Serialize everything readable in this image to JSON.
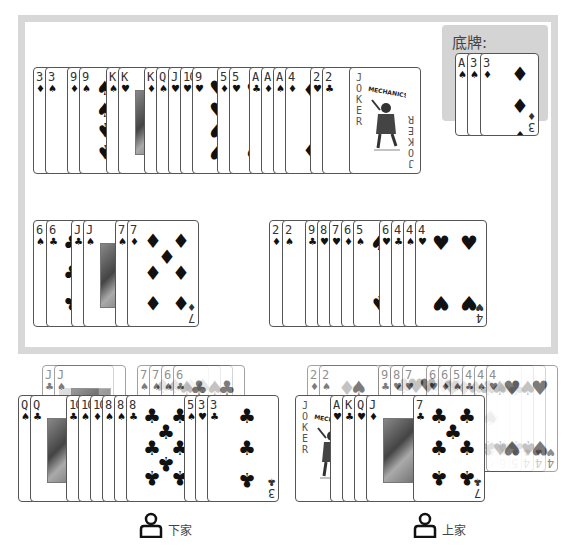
{
  "table": {
    "played_row_top": [
      {
        "rank": "3",
        "suit": "♦"
      },
      {
        "rank": "3",
        "suit": "♠"
      },
      {
        "rank": "9",
        "suit": "♦"
      },
      {
        "rank": "9",
        "suit": "♠"
      },
      {
        "rank": "K",
        "suit": "♠"
      },
      {
        "rank": "K",
        "suit": "♥"
      },
      {
        "rank": "K",
        "suit": "♦"
      },
      {
        "rank": "Q",
        "suit": "♠"
      },
      {
        "rank": "J",
        "suit": "♥"
      },
      {
        "rank": "10",
        "suit": "♥"
      },
      {
        "rank": "9",
        "suit": "♥"
      },
      {
        "rank": "5",
        "suit": "♦"
      },
      {
        "rank": "5",
        "suit": "♥"
      },
      {
        "rank": "A",
        "suit": "♣"
      },
      {
        "rank": "A",
        "suit": "♦"
      },
      {
        "rank": "A",
        "suit": "♠"
      },
      {
        "rank": "4",
        "suit": "♦"
      },
      {
        "rank": "2",
        "suit": "♥"
      },
      {
        "rank": "2",
        "suit": "♣"
      },
      {
        "rank": "JOKER",
        "suit": ""
      }
    ],
    "played_row_left": [
      {
        "rank": "6",
        "suit": "♠"
      },
      {
        "rank": "6",
        "suit": "♣"
      },
      {
        "rank": "J",
        "suit": "♣"
      },
      {
        "rank": "J",
        "suit": "♠"
      },
      {
        "rank": "7",
        "suit": "♠"
      },
      {
        "rank": "7",
        "suit": "♦"
      }
    ],
    "played_row_right": [
      {
        "rank": "2",
        "suit": "♦"
      },
      {
        "rank": "2",
        "suit": "♠"
      },
      {
        "rank": "9",
        "suit": "♣"
      },
      {
        "rank": "8",
        "suit": "♥"
      },
      {
        "rank": "7",
        "suit": "♥"
      },
      {
        "rank": "6",
        "suit": "♦"
      },
      {
        "rank": "5",
        "suit": "♠"
      },
      {
        "rank": "6",
        "suit": "♥"
      },
      {
        "rank": "4",
        "suit": "♣"
      },
      {
        "rank": "4",
        "suit": "♠"
      },
      {
        "rank": "4",
        "suit": "♥"
      }
    ],
    "joker_brand": "MECHANICS",
    "joker_word": "JOKER"
  },
  "bottom_cards": {
    "title": "底牌:",
    "cards": [
      {
        "rank": "A",
        "suit": "♠"
      },
      {
        "rank": "3",
        "suit": "♠"
      },
      {
        "rank": "3",
        "suit": "♦"
      }
    ]
  },
  "players": {
    "next": {
      "label": "下家",
      "icon": "user-icon",
      "hand_back_row": [
        {
          "rank": "J",
          "suit": "♣"
        },
        {
          "rank": "J",
          "suit": "♠"
        },
        {
          "rank": "7",
          "suit": "♠"
        },
        {
          "rank": "7",
          "suit": "♠"
        },
        {
          "rank": "6",
          "suit": "♠"
        },
        {
          "rank": "6",
          "suit": "♣"
        }
      ],
      "hand_front_row": [
        {
          "rank": "Q",
          "suit": "♠"
        },
        {
          "rank": "Q",
          "suit": "♣"
        },
        {
          "rank": "10",
          "suit": "♣"
        },
        {
          "rank": "10",
          "suit": "♠"
        },
        {
          "rank": "10",
          "suit": "♦"
        },
        {
          "rank": "8",
          "suit": "♠"
        },
        {
          "rank": "8",
          "suit": "♠"
        },
        {
          "rank": "8",
          "suit": "♣"
        },
        {
          "rank": "5",
          "suit": "♠"
        },
        {
          "rank": "3",
          "suit": "♥"
        },
        {
          "rank": "3",
          "suit": "♣"
        }
      ]
    },
    "previous": {
      "label": "上家",
      "icon": "user-icon",
      "hand_back_row": [
        {
          "rank": "2",
          "suit": "♦"
        },
        {
          "rank": "2",
          "suit": "♠"
        },
        {
          "rank": "9",
          "suit": "♣"
        },
        {
          "rank": "8",
          "suit": "♥"
        },
        {
          "rank": "7",
          "suit": "♥"
        },
        {
          "rank": "6",
          "suit": "♥"
        },
        {
          "rank": "6",
          "suit": "♦"
        },
        {
          "rank": "5",
          "suit": "♠"
        },
        {
          "rank": "4",
          "suit": "♣"
        },
        {
          "rank": "4",
          "suit": "♠"
        },
        {
          "rank": "4",
          "suit": "♥"
        }
      ],
      "hand_front_row": [
        {
          "rank": "JOKER",
          "suit": ""
        },
        {
          "rank": "A",
          "suit": "♥"
        },
        {
          "rank": "K",
          "suit": "♣"
        },
        {
          "rank": "Q",
          "suit": "♥"
        },
        {
          "rank": "J",
          "suit": "♦"
        },
        {
          "rank": "7",
          "suit": "♣"
        }
      ]
    }
  }
}
